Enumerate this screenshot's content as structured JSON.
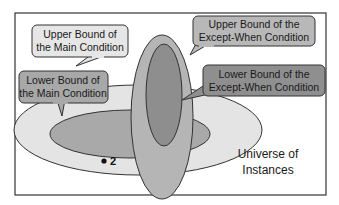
{
  "colors": {
    "background": "#ffffff",
    "frame_border": "#333333",
    "main_upper_fill": "#e4e4e4",
    "main_lower_fill": "#a9a9a9",
    "except_upper_fill": "#b5b5b5",
    "except_lower_fill": "#8e8e8e",
    "callout_upper_main_fill": "#e6e6e6",
    "callout_lower_main_fill": "#a8a8a8",
    "callout_upper_except_fill": "#b8b8b8",
    "callout_lower_except_fill": "#8f8f8f",
    "stroke": "#333333"
  },
  "callouts": {
    "upper_main": {
      "line1": "Upper Bound of",
      "line2": "the Main Condition"
    },
    "lower_main": {
      "line1": "Lower Bound of",
      "line2": "the Main Condition"
    },
    "upper_except": {
      "line1": "Upper Bound of the",
      "line2": "Except-When Condition"
    },
    "lower_except": {
      "line1": "Lower Bound of the",
      "line2": "Except-When Condition"
    }
  },
  "universe": {
    "line1": "Universe of",
    "line2": "Instances"
  },
  "point": {
    "label": "2"
  }
}
